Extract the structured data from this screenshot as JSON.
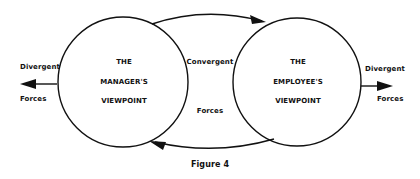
{
  "diagram": {
    "left_circle": {
      "lines": [
        "THE",
        "MANAGER'S",
        "VIEWPOINT"
      ]
    },
    "right_circle": {
      "lines": [
        "THE",
        "EMPLOYEE'S",
        "VIEWPOINT"
      ]
    },
    "left_outer": {
      "top": "Divergent",
      "bottom": "Forces"
    },
    "right_outer": {
      "top": "Divergent",
      "bottom": "Forces"
    },
    "middle": {
      "top": "Convergent",
      "bottom": "Forces"
    },
    "caption": "Figure 4"
  }
}
